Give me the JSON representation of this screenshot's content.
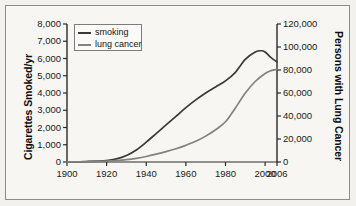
{
  "chart_data": {
    "type": "line",
    "title": "",
    "xlabel": "",
    "ylabel": "Cigarettes Smoked/yr",
    "ylabel_right": "Persons with Lung Cancer",
    "xlim": [
      1900,
      2006
    ],
    "ylim": [
      0,
      8000
    ],
    "ylim_right": [
      0,
      120000
    ],
    "grid": false,
    "legend_position": "upper-left",
    "xticks": [
      "1900",
      "1920",
      "1940",
      "1960",
      "1980",
      "2000",
      "2006"
    ],
    "xtick_values": [
      1900,
      1920,
      1940,
      1960,
      1980,
      2000,
      2006
    ],
    "yticks_left": [
      "0",
      "1,000",
      "2,000",
      "3,000",
      "4,000",
      "5,000",
      "6,000",
      "7,000",
      "8,000"
    ],
    "ytick_values_left": [
      0,
      1000,
      2000,
      3000,
      4000,
      5000,
      6000,
      7000,
      8000
    ],
    "yticks_right": [
      "0",
      "20,000",
      "40,000",
      "60,000",
      "80,000",
      "100,000",
      "120,000"
    ],
    "ytick_values_right": [
      0,
      20000,
      40000,
      60000,
      80000,
      100000,
      120000
    ],
    "series": [
      {
        "name": "smoking",
        "axis": "left",
        "color": "#3a3a3a",
        "x": [
          1900,
          1910,
          1920,
          1925,
          1930,
          1935,
          1940,
          1945,
          1950,
          1955,
          1960,
          1965,
          1970,
          1975,
          1980,
          1985,
          1990,
          1995,
          1998,
          2000,
          2003,
          2006
        ],
        "values": [
          10,
          30,
          80,
          180,
          380,
          700,
          1150,
          1650,
          2150,
          2650,
          3150,
          3600,
          4000,
          4350,
          4700,
          5200,
          5950,
          6380,
          6450,
          6380,
          6050,
          5800
        ]
      },
      {
        "name": "lung cancer",
        "axis": "right",
        "color": "#82827e",
        "x": [
          1900,
          1910,
          1920,
          1925,
          1930,
          1935,
          1940,
          1945,
          1950,
          1955,
          1960,
          1965,
          1970,
          1975,
          1980,
          1985,
          1990,
          1995,
          2000,
          2003,
          2006
        ],
        "values": [
          100,
          300,
          700,
          1200,
          2000,
          3200,
          4800,
          6800,
          9000,
          11500,
          14500,
          18000,
          22500,
          28000,
          35000,
          47000,
          60000,
          70000,
          77000,
          79500,
          80500
        ]
      }
    ]
  },
  "legend": {
    "items": [
      {
        "label": "smoking",
        "color": "#3a3a3a"
      },
      {
        "label": "lung cancer",
        "color": "#82827e"
      }
    ]
  }
}
